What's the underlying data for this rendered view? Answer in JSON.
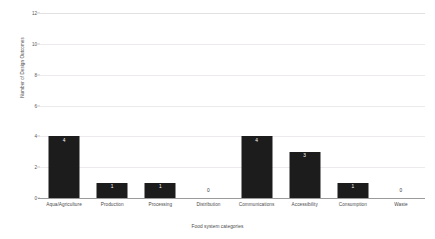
{
  "chart_data": {
    "type": "bar",
    "title": "Number of design outcomes per food system category",
    "xlabel": "Food system categories",
    "ylabel": "Number of Design Outcomes",
    "categories": [
      "Aqua/Agriculture",
      "Production",
      "Processing",
      "Distribution",
      "Communications",
      "Accessibility",
      "Consumption",
      "Waste"
    ],
    "values": [
      4,
      1,
      1,
      0,
      4,
      3,
      1,
      0
    ],
    "value_labels": [
      "4",
      "1",
      "1",
      "0",
      "4",
      "3",
      "1",
      "0"
    ],
    "ylim": [
      0,
      12
    ],
    "yticks": [
      0,
      2,
      4,
      6,
      8,
      10,
      12
    ],
    "ytick_labels": [
      "0",
      "2",
      "4",
      "6",
      "8",
      "10",
      "12"
    ],
    "grid": "horizontal",
    "legend": "none",
    "bar_color": "#1c1c1c",
    "gridline_color": "#eceaec",
    "axis_color": "#9a9a9a",
    "inside_label_color": "#ffffff",
    "zero_label_color": "#3a3a3a"
  }
}
